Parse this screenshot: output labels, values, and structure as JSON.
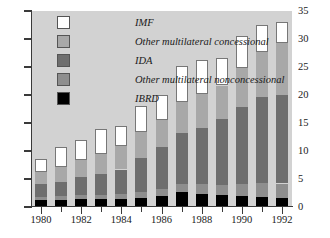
{
  "chart_data": {
    "type": "bar",
    "subtype": "stacked-vertical",
    "title": "",
    "subtitle": "",
    "xlabel": "",
    "ylabel": "",
    "ylim": [
      0,
      35
    ],
    "yticks": [
      0,
      5,
      10,
      15,
      20,
      25,
      30,
      35
    ],
    "ytick_labels": [
      "0",
      "5",
      "10",
      "15",
      "20",
      "25",
      "30",
      "35"
    ],
    "y_axis_position": "right",
    "grid": false,
    "legend_position": "top-left",
    "background_color": "#d2d2d2",
    "categories": [
      "1980",
      "1981",
      "1982",
      "1983",
      "1984",
      "1985",
      "1986",
      "1987",
      "1988",
      "1989",
      "1990",
      "1991",
      "1992"
    ],
    "xtick_labels": [
      "1980",
      "",
      "1982",
      "",
      "1984",
      "",
      "1986",
      "",
      "1988",
      "",
      "1990",
      "",
      "1992"
    ],
    "stack_order_bottom_to_top": [
      "IBRD",
      "Other multilateral nonconcessional",
      "IDA",
      "Other multilateral concessional",
      "IMF"
    ],
    "series": [
      {
        "name": "IBRD",
        "color": "#000000",
        "values": [
          1.3,
          1.3,
          1.4,
          1.4,
          1.4,
          1.6,
          1.9,
          2.6,
          2.4,
          2.1,
          2.0,
          1.8,
          1.6
        ]
      },
      {
        "name": "Other multilateral nonconcessional",
        "color": "#8e8e8e",
        "values": [
          0.5,
          0.6,
          0.7,
          0.8,
          0.9,
          1.1,
          1.3,
          1.5,
          1.7,
          1.9,
          2.1,
          2.4,
          2.6
        ]
      },
      {
        "name": "IDA",
        "color": "#6e6e6e",
        "values": [
          2.3,
          2.6,
          3.2,
          3.7,
          4.4,
          6.1,
          7.5,
          9.1,
          10.0,
          11.7,
          13.7,
          15.4,
          15.8
        ]
      },
      {
        "name": "Other multilateral concessional",
        "color": "#a8a8a8",
        "values": [
          2.2,
          2.7,
          3.1,
          3.6,
          4.2,
          4.6,
          4.8,
          5.5,
          6.0,
          6.0,
          7.1,
          8.1,
          9.2
        ]
      },
      {
        "name": "IMF",
        "color": "#ffffff",
        "values": [
          2.3,
          3.5,
          3.6,
          4.4,
          3.6,
          4.7,
          4.5,
          6.5,
          6.2,
          4.9,
          5.7,
          4.8,
          3.8
        ]
      }
    ],
    "totals": [
      8.6,
      10.7,
      12.0,
      13.9,
      14.5,
      18.1,
      20.0,
      25.2,
      26.3,
      26.6,
      30.6,
      32.5,
      33.0
    ]
  },
  "legend": {
    "items": [
      {
        "label": "IMF",
        "key": "imf"
      },
      {
        "label": "Other multilateral concessional",
        "key": "omc"
      },
      {
        "label": "IDA",
        "key": "ida"
      },
      {
        "label": "Other multilateral nonconcessional",
        "key": "omn"
      },
      {
        "label": "IBRD",
        "key": "ibrd"
      }
    ]
  }
}
